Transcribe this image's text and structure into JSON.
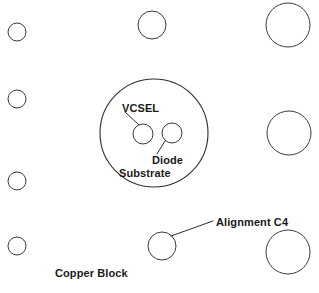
{
  "diagram": {
    "background_color": "#ffffff",
    "stroke_color": "#2e2e2e",
    "text_color": "#1a1a1a",
    "width": 319,
    "height": 293,
    "labels": {
      "vcsel": "VCSEL",
      "diode": "Diode",
      "substrate": "Substrate",
      "alignment_c4": "Alignment C4",
      "copper_block": "Copper Block"
    },
    "shapes": {
      "substrate_circle": {
        "name": "diode-substrate-outline",
        "cx": 154,
        "cy": 133,
        "r": 54
      },
      "vcsel_circle": {
        "name": "vcsel-aperture",
        "cx": 143,
        "cy": 134,
        "r": 10
      },
      "diode_circle": {
        "name": "diode-aperture",
        "cx": 172,
        "cy": 133,
        "r": 10
      },
      "c4_bumps": [
        {
          "name": "c4-bump-left-1",
          "cx": 17,
          "cy": 32,
          "r": 9
        },
        {
          "name": "c4-bump-left-2",
          "cx": 17,
          "cy": 99,
          "r": 9
        },
        {
          "name": "c4-bump-left-3",
          "cx": 17,
          "cy": 181,
          "r": 9
        },
        {
          "name": "c4-bump-left-4",
          "cx": 17,
          "cy": 246,
          "r": 9
        },
        {
          "name": "c4-bump-top-center",
          "cx": 152,
          "cy": 25,
          "r": 14
        },
        {
          "name": "c4-bump-bottom-center",
          "cx": 162,
          "cy": 246,
          "r": 14
        },
        {
          "name": "c4-bump-top-right",
          "cx": 288,
          "cy": 25,
          "r": 22
        },
        {
          "name": "c4-bump-middle-right",
          "cx": 289,
          "cy": 133,
          "r": 22
        },
        {
          "name": "c4-bump-bottom-right",
          "cx": 288,
          "cy": 252,
          "r": 22
        }
      ],
      "leaders": [
        {
          "name": "vcsel-leader-line",
          "x1": 125,
          "y1": 112,
          "x2": 139,
          "y2": 125
        },
        {
          "name": "diode-leader-line",
          "x1": 165,
          "y1": 141,
          "x2": 157,
          "y2": 154
        },
        {
          "name": "alignment-c4-leader-line",
          "x1": 171,
          "y1": 236,
          "x2": 213,
          "y2": 221
        }
      ]
    }
  }
}
